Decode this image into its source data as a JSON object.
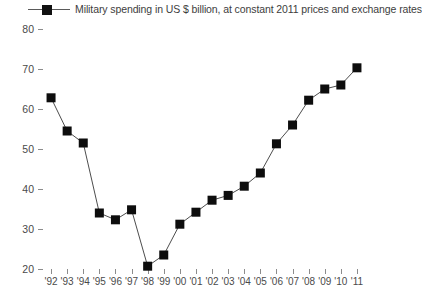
{
  "legend": {
    "label": "Military spending in US $ billion, at constant 2011 prices and exchange rates",
    "marker_icon": "filled-square-marker",
    "color": "#111111"
  },
  "chart_data": {
    "type": "line",
    "title": "",
    "subtitle": "",
    "xlabel": "",
    "ylabel": "",
    "categories": [
      "'92",
      "'93",
      "'94",
      "'95",
      "'96",
      "'97",
      "'98",
      "'99",
      "'00",
      "'01",
      "'02",
      "'03",
      "'04",
      "'05",
      "'06",
      "'07",
      "'08",
      "'09",
      "'10",
      "'11"
    ],
    "x": [
      1992,
      1993,
      1994,
      1995,
      1996,
      1997,
      1998,
      1999,
      2000,
      2001,
      2002,
      2003,
      2004,
      2005,
      2006,
      2007,
      2008,
      2009,
      2010,
      2011
    ],
    "values": [
      62.8,
      54.5,
      51.5,
      34.0,
      32.3,
      34.8,
      20.7,
      23.5,
      31.2,
      34.2,
      37.2,
      38.4,
      40.7,
      44.0,
      51.3,
      56.0,
      62.2,
      65.0,
      66.0,
      70.3
    ],
    "series": [
      {
        "name": "Military spending in US $ billion, at constant 2011 prices and exchange rates",
        "color": "#111111",
        "marker": "square",
        "values": [
          62.8,
          54.5,
          51.5,
          34.0,
          32.3,
          34.8,
          20.7,
          23.5,
          31.2,
          34.2,
          37.2,
          38.4,
          40.7,
          44.0,
          51.3,
          56.0,
          62.2,
          65.0,
          66.0,
          70.3
        ]
      }
    ],
    "ylim": [
      20,
      80
    ],
    "yticks": [
      20,
      30,
      40,
      50,
      60,
      70,
      80
    ],
    "ytick_labels": [
      "20",
      "30",
      "40",
      "50",
      "60",
      "70",
      "80"
    ],
    "grid": false,
    "legend_position": "top-left",
    "units": "US $ billion (constant 2011 prices and exchange rates)"
  }
}
